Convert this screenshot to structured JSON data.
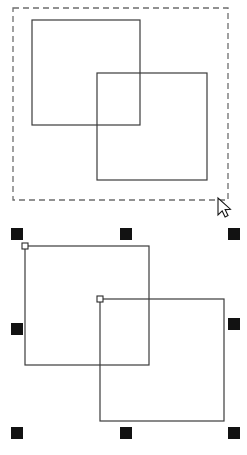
{
  "document": {
    "title": "Vector selection illustration",
    "background_color": "#ffffff",
    "width": 247,
    "height": 455
  },
  "panels": [
    {
      "id": "marquee-selection-panel",
      "name": "Rubber-band marquee selection",
      "caption": "",
      "x": 0,
      "y": 0,
      "width": 247,
      "height": 228
    },
    {
      "id": "handle-selection-panel",
      "name": "Selected objects with resize handles",
      "caption": "",
      "x": 0,
      "y": 228,
      "width": 247,
      "height": 227
    }
  ],
  "marquee": {
    "name": "marquee-rectangle",
    "x": 13,
    "y": 8,
    "width": 215,
    "height": 192,
    "stroke_color": "#6e6e6e",
    "stroke_width": 1.3,
    "dash_pattern": "6 4",
    "fill": "none"
  },
  "cursor": {
    "name": "arrow-cursor",
    "tip_x": 218,
    "tip_y": 198,
    "fill_color": "#ffffff",
    "stroke_color": "#141414"
  },
  "shapes": {
    "stroke_color": "#3b3b3b",
    "stroke_width": 1.2,
    "fill": "none",
    "top_panel": [
      {
        "name": "rectangle-a",
        "x": 32,
        "y": 20,
        "width": 108,
        "height": 105
      },
      {
        "name": "rectangle-b",
        "x": 97,
        "y": 73,
        "width": 110,
        "height": 107
      }
    ],
    "bottom_panel": [
      {
        "name": "rectangle-a",
        "x": 25,
        "y": 246,
        "width": 124,
        "height": 119
      },
      {
        "name": "rectangle-b",
        "x": 100,
        "y": 299,
        "width": 124,
        "height": 122
      }
    ]
  },
  "selection": {
    "name": "selection-bounding-box",
    "handle_color": "#121212",
    "handle_size": 12,
    "handles": [
      {
        "name": "handle-top-left",
        "x": 11,
        "y": 228
      },
      {
        "name": "handle-top-center",
        "x": 120,
        "y": 228
      },
      {
        "name": "handle-top-right",
        "x": 228,
        "y": 228
      },
      {
        "name": "handle-middle-left",
        "x": 11,
        "y": 323
      },
      {
        "name": "handle-middle-right",
        "x": 228,
        "y": 318
      },
      {
        "name": "handle-bottom-left",
        "x": 11,
        "y": 427
      },
      {
        "name": "handle-bottom-center",
        "x": 120,
        "y": 427
      },
      {
        "name": "handle-bottom-right",
        "x": 228,
        "y": 427
      }
    ],
    "node_markers": [
      {
        "name": "node-marker-rectangle-a",
        "x": 25,
        "y": 246,
        "size": 6
      },
      {
        "name": "node-marker-rectangle-b",
        "x": 100,
        "y": 299,
        "size": 6
      }
    ],
    "node_fill": "#ffffff",
    "node_stroke": "#2a2a2a"
  }
}
